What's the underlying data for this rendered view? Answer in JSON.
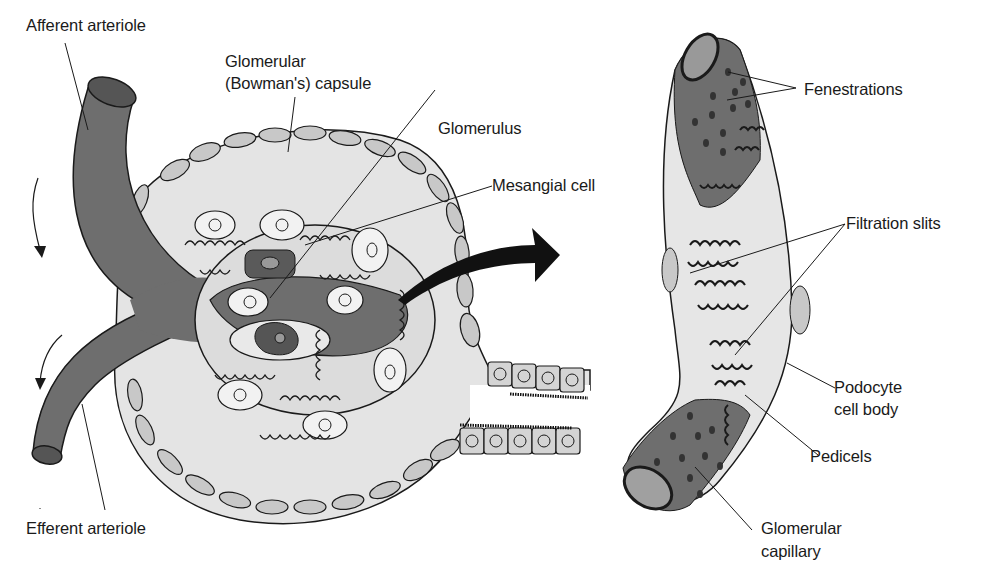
{
  "figure": {
    "colors": {
      "background": "#ffffff",
      "vessel": "#6e6e6e",
      "vessel_dark": "#505050",
      "capsule_space": "#e4e4e4",
      "capsule_cell": "#c8c8c8",
      "podocyte": "#e8e8e8",
      "outline": "#1a1a1a"
    }
  },
  "left_panel": {
    "labels": {
      "afferent_arteriole": "Afferent arteriole",
      "capsule_line1": "Glomerular",
      "capsule_line2": "(Bowman's) capsule",
      "glomerulus": "Glomerulus",
      "mesangial_cell": "Mesangial cell",
      "efferent_arteriole": "Efferent arteriole"
    }
  },
  "right_panel": {
    "labels": {
      "fenestrations": "Fenestrations",
      "filtration_slits": "Filtration slits",
      "podocyte_line1": "Podocyte",
      "podocyte_line2": "cell body",
      "pedicels": "Pedicels",
      "capillary_line1": "Glomerular",
      "capillary_line2": "capillary"
    }
  }
}
